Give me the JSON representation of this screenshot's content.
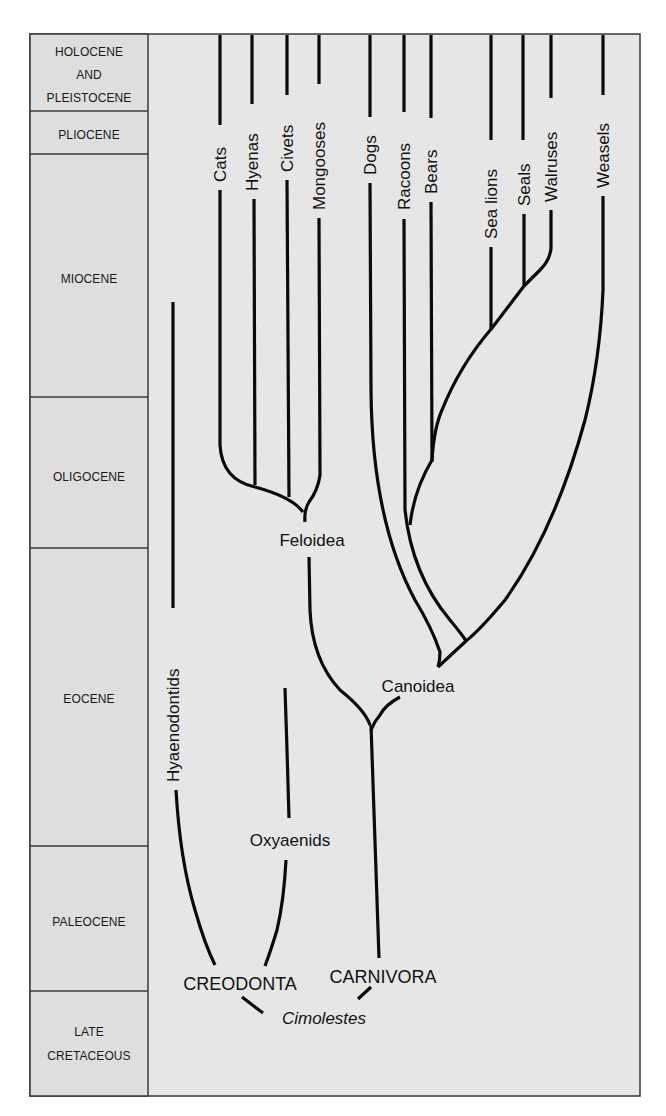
{
  "figure": {
    "type": "phylogenetic-tree-over-geologic-time",
    "background_color": "#e6e6e6",
    "border_color": "#3a3a3a",
    "line_color": "#0a0a0a"
  },
  "time_column": {
    "periods": [
      {
        "id": "holocene-pleistocene",
        "lines": [
          "HOLOCENE",
          "AND",
          "PLEISTOCENE"
        ]
      },
      {
        "id": "pliocene",
        "lines": [
          "PLIOCENE"
        ]
      },
      {
        "id": "miocene",
        "lines": [
          "MIOCENE"
        ]
      },
      {
        "id": "oligocene",
        "lines": [
          "OLIGOCENE"
        ]
      },
      {
        "id": "eocene",
        "lines": [
          "EOCENE"
        ]
      },
      {
        "id": "paleocene",
        "lines": [
          "PALEOCENE"
        ]
      },
      {
        "id": "late-cretaceous",
        "lines": [
          "LATE",
          "CRETACEOUS"
        ]
      }
    ]
  },
  "leaves": {
    "cats": "Cats",
    "hyenas": "Hyenas",
    "civets": "Civets",
    "mongooses": "Mongooses",
    "dogs": "Dogs",
    "racoons": "Racoons",
    "bears": "Bears",
    "sea_lions": "Sea lions",
    "seals": "Seals",
    "walruses": "Walruses",
    "weasels": "Weasels",
    "hyaenodontids": "Hyaenodontids"
  },
  "nodes": {
    "feloidea": "Feloidea",
    "canoidea": "Canoidea",
    "oxyaenids": "Oxyaenids",
    "creodonta": "CREODONTA",
    "carnivora": "CARNIVORA",
    "cimolestes": "Cimolestes"
  }
}
